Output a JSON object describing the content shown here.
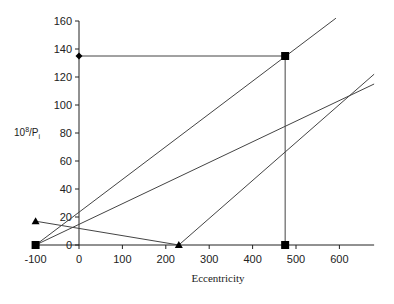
{
  "chart_data": {
    "type": "line",
    "title": "",
    "xlabel": "Eccentricity",
    "ylabel": "10^8/P_i",
    "ylabel_parts": {
      "base": "10",
      "sup": "8",
      "mid": "/P",
      "sub": "i"
    },
    "xlim": [
      -100,
      680
    ],
    "ylim": [
      0,
      160
    ],
    "xticks": [
      -100,
      0,
      100,
      200,
      300,
      400,
      500,
      600
    ],
    "yticks": [
      0,
      20,
      40,
      60,
      80,
      100,
      120,
      140,
      160
    ],
    "grid": false,
    "legend": null,
    "series": [
      {
        "name": "line-1",
        "points": [
          [
            -100,
            0
          ],
          [
            592,
            162
          ]
        ],
        "marker": "none"
      },
      {
        "name": "line-2",
        "points": [
          [
            -100,
            0
          ],
          [
            680,
            115
          ]
        ],
        "marker": "none"
      },
      {
        "name": "line-3",
        "points": [
          [
            230,
            0
          ],
          [
            680,
            122
          ]
        ],
        "marker": "none"
      },
      {
        "name": "line-4",
        "points": [
          [
            -100,
            17
          ],
          [
            230,
            0
          ]
        ],
        "marker": "triangle"
      },
      {
        "name": "construction-horizontal",
        "points": [
          [
            0,
            135
          ],
          [
            475,
            135
          ]
        ],
        "marker": "none"
      },
      {
        "name": "construction-vertical",
        "points": [
          [
            475,
            135
          ],
          [
            475,
            0
          ]
        ],
        "marker": "none"
      }
    ],
    "markers": [
      {
        "shape": "diamond",
        "x": 0,
        "y": 135
      },
      {
        "shape": "square",
        "x": 475,
        "y": 135
      },
      {
        "shape": "square",
        "x": 475,
        "y": 0
      },
      {
        "shape": "square",
        "x": -100,
        "y": 0
      },
      {
        "shape": "triangle",
        "x": -100,
        "y": 17
      },
      {
        "shape": "triangle",
        "x": 230,
        "y": 0
      }
    ],
    "colors": {
      "line": "#444444",
      "marker": "#000000",
      "axis": "#222222"
    }
  }
}
